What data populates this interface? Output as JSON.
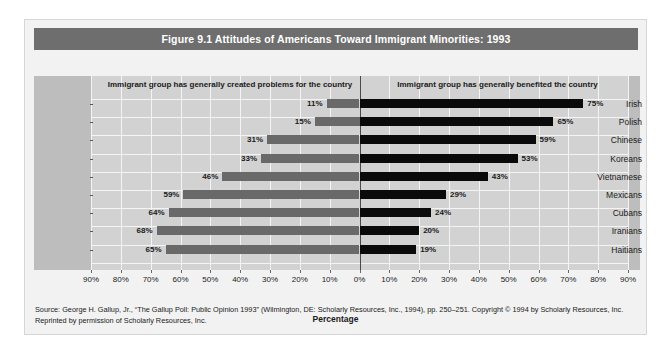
{
  "figure": {
    "title": "Figure 9.1  Attitudes of Americans Toward Immigrant Minorities: 1993",
    "source_line1": "Source: George H. Gallup, Jr., “The Gallup Poll: Public Opinion 1993” (Wilmington, DE: Scholarly Resources, Inc., 1994), pp. 250–251. Copyright © 1994 by Scholarly",
    "source_line2": "Resources, Inc. Reprinted by permission of Scholarly Resources, Inc.",
    "colors": {
      "title_banner": "#6e6e6e",
      "card_background": "#f2f2f2",
      "plot_background": "#d2d2d2",
      "label_band": "#bdbdbd",
      "gridline": "#f4f4f4",
      "bar_left": "#696969",
      "bar_right": "#0a0a0a",
      "zero_line": "#4a4a4a"
    }
  },
  "chart_data": {
    "type": "bar",
    "title": "Figure 9.1  Attitudes of Americans Toward Immigrant Minorities: 1993",
    "subtitle": "",
    "orientation": "horizontal-diverging",
    "categories": [
      "Irish",
      "Polish",
      "Chinese",
      "Koreans",
      "Vietnamese",
      "Mexicans",
      "Cubans",
      "Iranians",
      "Haitians"
    ],
    "series": [
      {
        "name": "Immigrant group has generally created problems for the country",
        "direction": "left",
        "color": "#696969",
        "values": [
          11,
          15,
          31,
          33,
          46,
          59,
          64,
          68,
          65
        ],
        "labels": [
          "11%",
          "15%",
          "31%",
          "33%",
          "46%",
          "59%",
          "64%",
          "68%",
          "65%"
        ]
      },
      {
        "name": "Immigrant group has generally benefited the country",
        "direction": "right",
        "color": "#0a0a0a",
        "values": [
          75,
          65,
          59,
          53,
          43,
          29,
          24,
          20,
          19
        ],
        "labels": [
          "75%",
          "65%",
          "59%",
          "53%",
          "43%",
          "29%",
          "24%",
          "20%",
          "19%"
        ]
      }
    ],
    "xlabel": "Percentage",
    "ylabel": "",
    "xlim": [
      -90,
      90
    ],
    "xticks": [
      -90,
      -80,
      -70,
      -60,
      -50,
      -40,
      -30,
      -20,
      -10,
      0,
      10,
      20,
      30,
      40,
      50,
      60,
      70,
      80,
      90
    ],
    "xticklabels": [
      "90%",
      "80%",
      "70%",
      "60%",
      "50%",
      "40%",
      "30%",
      "20%",
      "10%",
      "0%",
      "10%",
      "20%",
      "30%",
      "40%",
      "50%",
      "60%",
      "70%",
      "80%",
      "90%"
    ],
    "grid": true,
    "legend": "inline-column-headers"
  }
}
